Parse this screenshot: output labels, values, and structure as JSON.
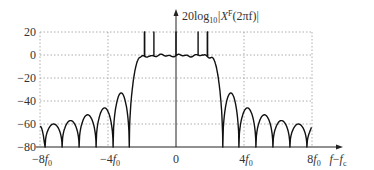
{
  "chart_data": {
    "type": "line",
    "title": "",
    "ylabel": "20log10|X^F(2πf)|",
    "ylabel_parts": {
      "base": "20log",
      "sub": "10",
      "mid": "|X",
      "sup": "F",
      "tail": "(2πf)|"
    },
    "xlabel": "f−f_c",
    "xlabel_parts": {
      "f": "f",
      "minus": "−",
      "fc": "f",
      "sub": "c"
    },
    "x_ticks": [
      {
        "value": -8,
        "label": "−8f",
        "sub": "0"
      },
      {
        "value": -4,
        "label": "−4f",
        "sub": "0"
      },
      {
        "value": 0,
        "label": "0",
        "sub": ""
      },
      {
        "value": 4,
        "label": "4f",
        "sub": "0"
      },
      {
        "value": 8,
        "label": "8f",
        "sub": "0"
      }
    ],
    "y_ticks": [
      {
        "value": 20,
        "label": "20"
      },
      {
        "value": 0,
        "label": "0"
      },
      {
        "value": -20,
        "label": "−20"
      },
      {
        "value": -40,
        "label": "−40"
      },
      {
        "value": -60,
        "label": "−60"
      },
      {
        "value": -80,
        "label": "−80"
      }
    ],
    "xlim": [
      -8,
      8
    ],
    "ylim": [
      -80,
      20
    ],
    "grid": true,
    "x_unit": "f0",
    "passband": {
      "range": [
        -2.6,
        2.6
      ],
      "level_db": 0,
      "spikes_at": [
        -2.6,
        -1.3,
        0,
        1.3,
        2.6
      ],
      "spike_level_db": 20
    },
    "sidelobes_left": [
      {
        "center": -3.2,
        "peak_db": -33
      },
      {
        "center": -4.2,
        "peak_db": -46
      },
      {
        "center": -5.2,
        "peak_db": -52
      },
      {
        "center": -6.2,
        "peak_db": -57
      },
      {
        "center": -7.2,
        "peak_db": -60
      }
    ],
    "sidelobes_right": [
      {
        "center": 3.2,
        "peak_db": -33
      },
      {
        "center": 4.2,
        "peak_db": -46
      },
      {
        "center": 5.2,
        "peak_db": -52
      },
      {
        "center": 6.2,
        "peak_db": -57
      },
      {
        "center": 7.2,
        "peak_db": -60
      }
    ]
  }
}
